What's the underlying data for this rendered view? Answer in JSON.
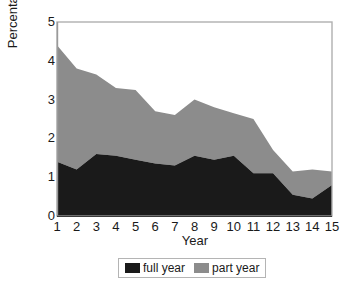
{
  "chart_data": {
    "type": "area",
    "stacked": true,
    "title": "",
    "xlabel": "Year",
    "ylabel": "Percentage",
    "categories": [
      "1",
      "2",
      "3",
      "4",
      "5",
      "6",
      "7",
      "8",
      "9",
      "10",
      "11",
      "12",
      "13",
      "14",
      "15"
    ],
    "x": [
      1,
      2,
      3,
      4,
      5,
      6,
      7,
      8,
      9,
      10,
      11,
      12,
      13,
      14,
      15
    ],
    "xlim": [
      1,
      15
    ],
    "ylim": [
      0,
      5
    ],
    "yticks": [
      "0",
      "1",
      "2",
      "3",
      "4",
      "5"
    ],
    "ytick_values": [
      0,
      1,
      2,
      3,
      4,
      5
    ],
    "grid": false,
    "legend_position": "bottom",
    "series": [
      {
        "name": "full year",
        "color": "#1a1a1a",
        "values": [
          1.4,
          1.2,
          1.6,
          1.55,
          1.45,
          1.35,
          1.3,
          1.55,
          1.45,
          1.55,
          1.1,
          1.1,
          0.55,
          0.45,
          0.8
        ]
      },
      {
        "name": "part year",
        "color": "#8c8c8c",
        "values": [
          3.0,
          2.6,
          2.05,
          1.75,
          1.8,
          1.35,
          1.3,
          1.45,
          1.35,
          1.1,
          1.4,
          0.6,
          0.6,
          0.75,
          0.35
        ]
      }
    ],
    "stack_totals": [
      4.4,
      3.8,
      3.65,
      3.3,
      3.25,
      2.7,
      2.6,
      3.0,
      2.8,
      2.65,
      2.5,
      1.7,
      1.15,
      1.2,
      1.15
    ]
  },
  "legend": {
    "items": [
      {
        "label": "full year",
        "color": "#1a1a1a"
      },
      {
        "label": "part year",
        "color": "#8c8c8c"
      }
    ]
  },
  "axes": {
    "y_title": "Percentage",
    "x_title": "Year"
  }
}
